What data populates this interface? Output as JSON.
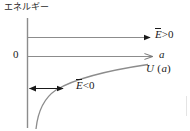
{
  "figure": {
    "type": "physics-energy-diagram",
    "width": 190,
    "height": 131,
    "background": "#ffffff",
    "line_color": "#8c8c8c",
    "arrow_color": "#1a1a1a",
    "curve_color": "#8c8c8c",
    "text_color": "#1a1a1a",
    "axis_title": "エネルギー",
    "zero_label": "0",
    "labels": {
      "energy_positive": {
        "var": "E",
        "overbar": true,
        "relation": ">0",
        "full": "Ē>0"
      },
      "axis_variable": "a",
      "potential": {
        "var": "U",
        "arg": "(a)",
        "full": "U (a)"
      },
      "energy_negative": {
        "var": "E",
        "overbar": true,
        "relation": "<0",
        "full": "Ē<0"
      }
    },
    "geometry": {
      "y_axis_x": 27,
      "y_axis_top": 18,
      "y_axis_bottom": 128,
      "level_e_positive_y": 37,
      "level_zero_y": 56,
      "double_arrow_y": 88,
      "double_arrow_x_start": 28,
      "double_arrow_x_end": 64,
      "arrow_x_end": 152,
      "curve_start": [
        35,
        128
      ],
      "curve_end": [
        148,
        64
      ]
    }
  }
}
